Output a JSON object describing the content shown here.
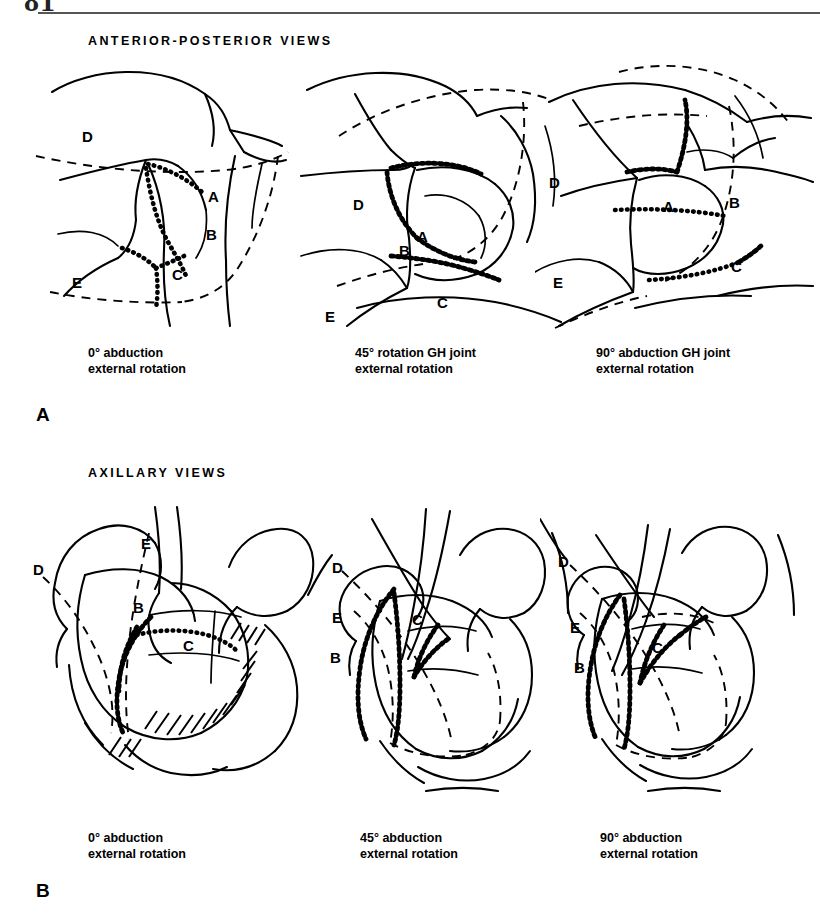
{
  "page": {
    "folio": "81",
    "sections": [
      {
        "id": "ap",
        "heading": "ANTERIOR-POSTERIOR VIEWS",
        "part_letter": "A"
      },
      {
        "id": "ax",
        "heading": "AXILLARY VIEWS",
        "part_letter": "B"
      }
    ]
  },
  "ap_views": {
    "heading": "ANTERIOR-POSTERIOR VIEWS",
    "part_letter": "A",
    "panels": [
      {
        "caption_line1": "0° abduction",
        "caption_line2": "external rotation",
        "labels": [
          "D",
          "A",
          "B",
          "C",
          "E"
        ]
      },
      {
        "caption_line1": "45° rotation GH joint",
        "caption_line2": "external rotation",
        "labels": [
          "D",
          "A",
          "B",
          "C",
          "E"
        ]
      },
      {
        "caption_line1": "90° abduction GH joint",
        "caption_line2": "external rotation",
        "labels": [
          "D",
          "A",
          "B",
          "C",
          "E"
        ]
      }
    ]
  },
  "axillary_views": {
    "heading": "AXILLARY VIEWS",
    "part_letter": "B",
    "panels": [
      {
        "caption_line1": "0° abduction",
        "caption_line2": "external rotation",
        "labels": [
          "D",
          "E",
          "B",
          "C"
        ]
      },
      {
        "caption_line1": "45° abduction",
        "caption_line2": "external rotation",
        "labels": [
          "D",
          "E",
          "C",
          "B"
        ]
      },
      {
        "caption_line1": "90° abduction",
        "caption_line2": "external rotation",
        "labels": [
          "D",
          "E",
          "C",
          "B"
        ]
      }
    ]
  },
  "colors": {
    "ink": "#000000",
    "rule": "#555555",
    "paper": "#ffffff"
  }
}
